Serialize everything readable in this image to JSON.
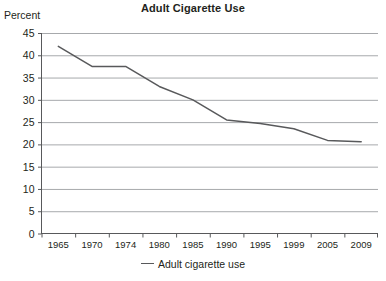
{
  "chart_data": {
    "type": "line",
    "title": "Adult Cigarette Use",
    "xlabel": "",
    "ylabel": "Percent",
    "x": [
      "1965",
      "1970",
      "1974",
      "1980",
      "1985",
      "1990",
      "1995",
      "1999",
      "2005",
      "2009"
    ],
    "categories": [
      "1965",
      "1970",
      "1974",
      "1980",
      "1985",
      "1990",
      "1995",
      "1999",
      "2005",
      "2009"
    ],
    "series": [
      {
        "name": "Adult cigarette use",
        "values": [
          42.0,
          37.5,
          37.5,
          33.0,
          30.0,
          25.5,
          24.7,
          23.5,
          20.9,
          20.6
        ],
        "color": "#58595b"
      }
    ],
    "ylim": [
      0,
      45
    ],
    "yticks": [
      0,
      5,
      10,
      15,
      20,
      25,
      30,
      35,
      40,
      45
    ],
    "ytick_labels": [
      "0",
      "5",
      "10",
      "15",
      "20",
      "25",
      "30",
      "35",
      "40",
      "45"
    ],
    "grid": "horizontal",
    "legend": {
      "position": "bottom-center",
      "entries": [
        "Adult cigarette use"
      ]
    },
    "colors": {
      "line": "#58595b",
      "grid": "#a7a9ac",
      "axis": "#58595b",
      "text": "#231f20",
      "background": "#ffffff"
    }
  }
}
